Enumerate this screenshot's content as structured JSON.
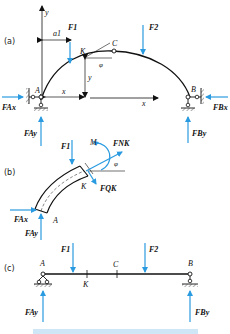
{
  "colors": {
    "force": "#2a9be0",
    "structure": "#111111",
    "caption": "#1f8fd8"
  },
  "panels": {
    "a": {
      "label": "(a)",
      "axis_y": "y",
      "axis_x": "x",
      "dim_a1": "a1",
      "point_K": "K",
      "point_C": "C",
      "point_A": "A",
      "point_B": "B",
      "angle": "φ",
      "coord_x": "x",
      "coord_y": "y",
      "forces": {
        "F1": "F1",
        "F2": "F2",
        "FAx": "FAx",
        "FAy": "FAy",
        "FBx": "FBx",
        "FBy": "FBy"
      }
    },
    "b": {
      "label": "(b)",
      "moment": "M",
      "point_K": "K",
      "point_A": "A",
      "angle": "φ",
      "forces": {
        "F1": "F1",
        "FNK": "FNK",
        "FQK": "FQK",
        "FAx": "FAx",
        "FAy": "FAy"
      }
    },
    "c": {
      "label": "(c)",
      "point_A": "A",
      "point_B": "B",
      "point_C": "C",
      "point_K": "K",
      "forces": {
        "F1": "F1",
        "F2": "F2",
        "FAy": "FAy",
        "FBy": "FBy"
      }
    }
  }
}
